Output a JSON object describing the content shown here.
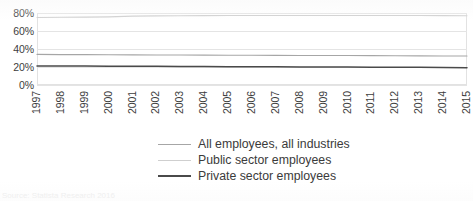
{
  "chart_data": {
    "type": "line",
    "title": "",
    "subtitle": "",
    "xlabel": "",
    "ylabel": "",
    "grid": true,
    "legend_position": "bottom",
    "ylim": [
      0,
      0.8
    ],
    "ytick_labels": [
      "80%",
      "60%",
      "40%",
      "20%",
      "0%"
    ],
    "ytick_values": [
      0.8,
      0.6,
      0.4,
      0.2,
      0.0
    ],
    "categories": [
      "1997",
      "1998",
      "1999",
      "2000",
      "2001",
      "2002",
      "2003",
      "2004",
      "2005",
      "2006",
      "2007",
      "2008",
      "2009",
      "2010",
      "2011",
      "2012",
      "2013",
      "2014",
      "2015"
    ],
    "series": [
      {
        "name": "All employees, all industries",
        "color": "#a6a6a6",
        "values": [
          0.34,
          0.338,
          0.337,
          0.336,
          0.335,
          0.334,
          0.333,
          0.332,
          0.331,
          0.33,
          0.329,
          0.328,
          0.328,
          0.327,
          0.326,
          0.325,
          0.324,
          0.323,
          0.322
        ]
      },
      {
        "name": "Public sector employees",
        "color": "#cfcfcf",
        "values": [
          0.75,
          0.752,
          0.754,
          0.757,
          0.765,
          0.768,
          0.77,
          0.771,
          0.772,
          0.772,
          0.772,
          0.772,
          0.773,
          0.773,
          0.773,
          0.772,
          0.772,
          0.771,
          0.77
        ]
      },
      {
        "name": "Private sector employees",
        "color": "#4a4a4a",
        "values": [
          0.212,
          0.211,
          0.21,
          0.209,
          0.208,
          0.207,
          0.206,
          0.205,
          0.204,
          0.203,
          0.202,
          0.201,
          0.2,
          0.199,
          0.198,
          0.197,
          0.196,
          0.195,
          0.193
        ]
      }
    ]
  },
  "legend": {
    "items": [
      {
        "label": "All employees, all industries",
        "color": "#a6a6a6",
        "width": 1.6
      },
      {
        "label": "Public sector employees",
        "color": "#cfcfcf",
        "width": 1.6
      },
      {
        "label": "Private sector employees",
        "color": "#4a4a4a",
        "width": 2.2
      }
    ]
  },
  "source_note": "Source: Statista Research 2016"
}
